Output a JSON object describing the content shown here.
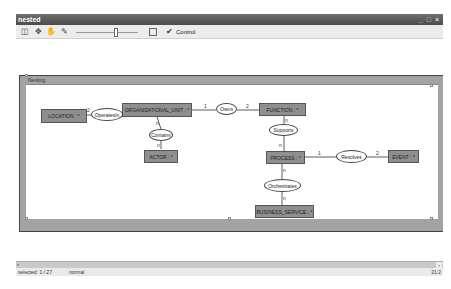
{
  "window": {
    "title": "nested",
    "controls": [
      "_",
      "□",
      "×"
    ]
  },
  "toolbar": {
    "icons": [
      "layout-icon",
      "move-icon",
      "hand-icon",
      "eraser-icon"
    ],
    "zoom_slider_pct": 65,
    "control_label": "Control"
  },
  "diagram": {
    "container_label": "Nesting",
    "entities": [
      {
        "id": "location",
        "label": "LOCATION : *"
      },
      {
        "id": "org_unit",
        "label": "ORGANISATIONAL_UNIT : *"
      },
      {
        "id": "function",
        "label": "FUNCTION : *"
      },
      {
        "id": "actor",
        "label": "ACTOR : *"
      },
      {
        "id": "process",
        "label": "PROCESS : *"
      },
      {
        "id": "event",
        "label": "EVENT : *"
      },
      {
        "id": "business_service",
        "label": "BUSINESS_SERVICE : *"
      }
    ],
    "relations": [
      {
        "id": "operates_in",
        "label": "OperatesIn"
      },
      {
        "id": "owns",
        "label": "Owns"
      },
      {
        "id": "contains",
        "label": "Contains"
      },
      {
        "id": "supports",
        "label": "Supports"
      },
      {
        "id": "resolves",
        "label": "Resolves"
      },
      {
        "id": "orchestrates",
        "label": "Orchestrates"
      }
    ],
    "multiplicities": {
      "operates_in_loc": "2",
      "owns_left": "1",
      "owns_right": "2",
      "supports_top": "n",
      "supports_bottom": "n",
      "contains_top": "n",
      "contains_bottom": "n",
      "resolves_left": "1",
      "resolves_right": "2",
      "orchestrates_top": "n",
      "orchestrates_bottom": "n"
    }
  },
  "status": {
    "selected": "selected: 1 / 27",
    "mode": "normal",
    "zoom": "21:2"
  }
}
